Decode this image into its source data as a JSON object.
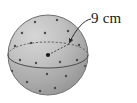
{
  "figure": {
    "type": "geometry-diagram",
    "background_color": "#ffffff",
    "label": {
      "text": "9 cm",
      "value": 9,
      "unit": "cm",
      "measure": "radius",
      "color": "#1a1a1a"
    },
    "sphere": {
      "center_x": 48,
      "center_y": 55,
      "radius": 40,
      "fill_light": "#cfcfcf",
      "fill_mid": "#b4b4b4",
      "fill_dark": "#9a9a9a",
      "outline_color": "#6e6e6e"
    },
    "equator": {
      "rx": 40,
      "ry": 13,
      "front_style": "solid",
      "back_style": "dashed",
      "color": "#555555"
    },
    "radius_arrow": {
      "from_x": 48,
      "from_y": 55,
      "to_x": 69,
      "to_y": 44,
      "style": "dashed",
      "color": "#333333"
    },
    "leader_line": {
      "from_x": 90,
      "from_y": 20,
      "to_x": 69,
      "to_y": 44,
      "color": "#333333"
    },
    "center_point": {
      "x": 48,
      "y": 55,
      "color": "#1a1a1a"
    },
    "speckles": [
      {
        "x": 35,
        "y": 22
      },
      {
        "x": 57,
        "y": 20
      },
      {
        "x": 22,
        "y": 33
      },
      {
        "x": 45,
        "y": 33
      },
      {
        "x": 68,
        "y": 31
      },
      {
        "x": 15,
        "y": 46
      },
      {
        "x": 31,
        "y": 43
      },
      {
        "x": 79,
        "y": 45
      },
      {
        "x": 20,
        "y": 60
      },
      {
        "x": 36,
        "y": 63
      },
      {
        "x": 60,
        "y": 62
      },
      {
        "x": 77,
        "y": 60
      },
      {
        "x": 12,
        "y": 71
      },
      {
        "x": 47,
        "y": 74
      },
      {
        "x": 66,
        "y": 76
      },
      {
        "x": 27,
        "y": 82
      },
      {
        "x": 55,
        "y": 88
      },
      {
        "x": 40,
        "y": 91
      },
      {
        "x": 72,
        "y": 20
      },
      {
        "x": 88,
        "y": 66
      }
    ]
  }
}
